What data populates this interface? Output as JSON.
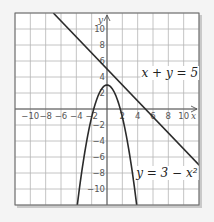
{
  "chart_data": {
    "type": "line",
    "title": "",
    "xlabel": "x",
    "ylabel": "y",
    "xlim": [
      -12,
      12
    ],
    "ylim": [
      -12,
      12
    ],
    "grid": true,
    "grid_step": 2,
    "x_ticks": [
      -10,
      -8,
      -6,
      -4,
      -2,
      2,
      4,
      6,
      8,
      10
    ],
    "x_tick_labels": [
      "−10",
      "−8",
      "−6",
      "−4",
      "−2",
      "2",
      "4",
      "6",
      "8",
      "10"
    ],
    "y_ticks": [
      10,
      8,
      6,
      4,
      2,
      -2,
      -4,
      -6,
      -8,
      -10
    ],
    "y_tick_labels": [
      "10",
      "8",
      "6",
      "4",
      "2",
      "−2",
      "−4",
      "−6",
      "−8",
      "−10"
    ],
    "series": [
      {
        "name": "x + y = 5",
        "kind": "linear",
        "equation": "y = 5 - x",
        "x": [
          -7,
          12
        ],
        "y": [
          12,
          -7
        ],
        "label": "x + y = 5",
        "label_anchor": [
          4.5,
          4
        ]
      },
      {
        "name": "y = 3 - x^2",
        "kind": "parabola",
        "equation": "y = 3 - x^2",
        "x_range": [
          -3.873,
          3.873
        ],
        "vertex": [
          0,
          3
        ],
        "label": "y = 3 − x²",
        "label_anchor": [
          3.8,
          -8.5
        ]
      }
    ],
    "colors": {
      "grid": "#b5b5b5",
      "axes": "#555555",
      "curves": "#2b2b2b",
      "frame": "#6a6a6a",
      "background": "#ffffff"
    }
  }
}
